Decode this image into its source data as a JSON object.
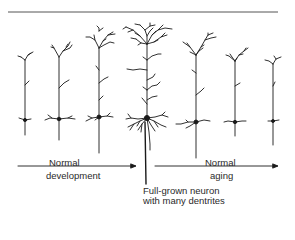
{
  "figure": {
    "labels": {
      "development_line1": "Normal",
      "development_line2": "development",
      "aging_line1": "Normal",
      "aging_line2": "aging",
      "fullgrown_line1": "Full-grown neuron",
      "fullgrown_line2": "with many dentrites"
    },
    "neurons": [
      {
        "stage": "developing",
        "order": 1
      },
      {
        "stage": "developing",
        "order": 2
      },
      {
        "stage": "developing",
        "order": 3
      },
      {
        "stage": "full-grown",
        "order": 4
      },
      {
        "stage": "aging",
        "order": 5
      },
      {
        "stage": "aging",
        "order": 6
      },
      {
        "stage": "aging",
        "order": 7
      }
    ],
    "colors": {
      "ink": "#1a1a1a",
      "rule": "#555555",
      "background": "#ffffff"
    }
  }
}
